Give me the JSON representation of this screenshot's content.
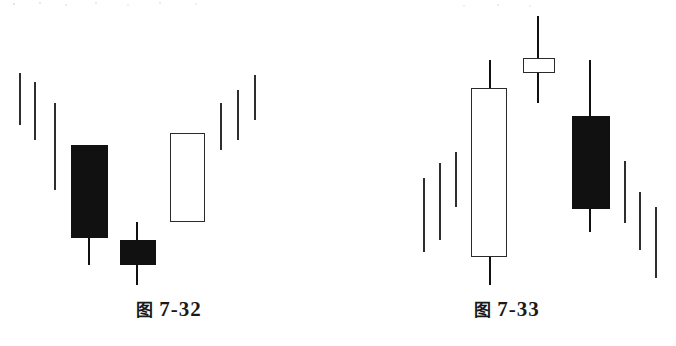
{
  "page": {
    "background_color": "#ffffff",
    "ink_color": "#111111",
    "outline_color": "#2a2a2a"
  },
  "chart_data": [
    {
      "type": "candlestick",
      "id": "figure-7-32",
      "title": "图 7-32",
      "caption_prefix": "图",
      "caption_number": "7-32",
      "xlabel": "",
      "ylabel": "",
      "grid": false,
      "legend": "none",
      "axis_visible": false,
      "pattern": "bullish reversal — downtrend, long black candle, small black star, then white candle and rally",
      "candles": [
        {
          "index": 1,
          "kind": "bar",
          "color": "outline",
          "x": 20,
          "high_y": 73,
          "low_y": 125,
          "body_top_y": null,
          "body_bottom_y": null,
          "body_left_x": null,
          "body_right_x": null
        },
        {
          "index": 2,
          "kind": "bar",
          "color": "outline",
          "x": 35,
          "high_y": 82,
          "low_y": 140,
          "body_top_y": null,
          "body_bottom_y": null,
          "body_left_x": null,
          "body_right_x": null
        },
        {
          "index": 3,
          "kind": "bar",
          "color": "outline",
          "x": 55,
          "high_y": 103,
          "low_y": 190,
          "body_top_y": null,
          "body_bottom_y": null,
          "body_left_x": null,
          "body_right_x": null
        },
        {
          "index": 4,
          "kind": "candle",
          "color": "black",
          "x": 89,
          "high_y": 145,
          "low_y": 265,
          "body_top_y": 145,
          "body_bottom_y": 238,
          "body_left_x": 71,
          "body_right_x": 108
        },
        {
          "index": 5,
          "kind": "candle",
          "color": "black",
          "x": 137,
          "high_y": 222,
          "low_y": 285,
          "body_top_y": 240,
          "body_bottom_y": 265,
          "body_left_x": 120,
          "body_right_x": 156
        },
        {
          "index": 6,
          "kind": "candle",
          "color": "white",
          "x": 187,
          "high_y": 133,
          "low_y": 222,
          "body_top_y": 133,
          "body_bottom_y": 222,
          "body_left_x": 170,
          "body_right_x": 205
        },
        {
          "index": 7,
          "kind": "bar",
          "color": "outline",
          "x": 221,
          "high_y": 103,
          "low_y": 150,
          "body_top_y": null,
          "body_bottom_y": null,
          "body_left_x": null,
          "body_right_x": null
        },
        {
          "index": 8,
          "kind": "bar",
          "color": "outline",
          "x": 238,
          "high_y": 90,
          "low_y": 140,
          "body_top_y": null,
          "body_bottom_y": null,
          "body_left_x": null,
          "body_right_x": null
        },
        {
          "index": 9,
          "kind": "bar",
          "color": "outline",
          "x": 255,
          "high_y": 75,
          "low_y": 120,
          "body_top_y": null,
          "body_bottom_y": null,
          "body_left_x": null,
          "body_right_x": null
        }
      ]
    },
    {
      "type": "candlestick",
      "id": "figure-7-33",
      "title": "图 7-33",
      "caption_prefix": "图",
      "caption_number": "7-33",
      "xlabel": "",
      "ylabel": "",
      "grid": false,
      "legend": "none",
      "axis_visible": false,
      "pattern": "bearish reversal — uptrend, long white candle, small white star, then black candle and decline",
      "candles": [
        {
          "index": 1,
          "kind": "bar",
          "color": "outline",
          "x": 86,
          "high_y": 178,
          "low_y": 252,
          "body_top_y": null,
          "body_bottom_y": null,
          "body_left_x": null,
          "body_right_x": null
        },
        {
          "index": 2,
          "kind": "bar",
          "color": "outline",
          "x": 102,
          "high_y": 163,
          "low_y": 240,
          "body_top_y": null,
          "body_bottom_y": null,
          "body_left_x": null,
          "body_right_x": null
        },
        {
          "index": 3,
          "kind": "bar",
          "color": "outline",
          "x": 118,
          "high_y": 152,
          "low_y": 207,
          "body_top_y": null,
          "body_bottom_y": null,
          "body_left_x": null,
          "body_right_x": null
        },
        {
          "index": 4,
          "kind": "candle",
          "color": "white",
          "x": 152,
          "high_y": 60,
          "low_y": 285,
          "body_top_y": 88,
          "body_bottom_y": 257,
          "body_left_x": 133,
          "body_right_x": 169
        },
        {
          "index": 5,
          "kind": "candle",
          "color": "white",
          "x": 200,
          "high_y": 16,
          "low_y": 103,
          "body_top_y": 58,
          "body_bottom_y": 73,
          "body_left_x": 185,
          "body_right_x": 217
        },
        {
          "index": 6,
          "kind": "candle",
          "color": "black",
          "x": 252,
          "high_y": 60,
          "low_y": 232,
          "body_top_y": 116,
          "body_bottom_y": 209,
          "body_left_x": 234,
          "body_right_x": 272
        },
        {
          "index": 7,
          "kind": "bar",
          "color": "outline",
          "x": 287,
          "high_y": 161,
          "low_y": 223,
          "body_top_y": null,
          "body_bottom_y": null,
          "body_left_x": null,
          "body_right_x": null
        },
        {
          "index": 8,
          "kind": "bar",
          "color": "outline",
          "x": 302,
          "high_y": 192,
          "low_y": 250,
          "body_top_y": null,
          "body_bottom_y": null,
          "body_left_x": null,
          "body_right_x": null
        },
        {
          "index": 9,
          "kind": "bar",
          "color": "outline",
          "x": 318,
          "high_y": 207,
          "low_y": 278,
          "body_top_y": null,
          "body_bottom_y": null,
          "body_left_x": null,
          "body_right_x": null
        }
      ]
    }
  ]
}
